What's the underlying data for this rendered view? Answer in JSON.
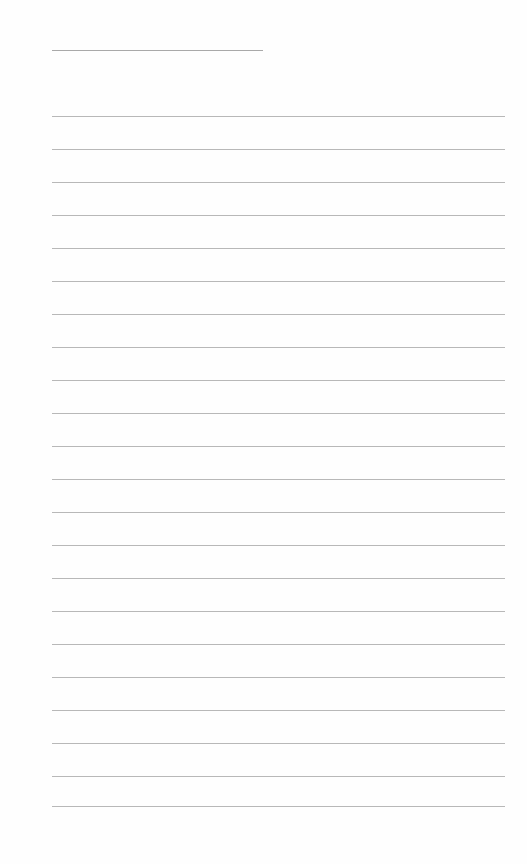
{
  "page": {
    "type": "blank lined notebook page",
    "header_line": {
      "x": 52,
      "y": 50,
      "width": 211
    },
    "rules": {
      "x": 52,
      "width": 453,
      "y_positions": [
        116,
        149,
        182,
        215,
        248,
        281,
        314,
        347,
        380,
        413,
        446,
        479,
        512,
        545,
        578,
        611,
        644,
        677,
        710,
        743,
        776,
        806
      ]
    },
    "colors": {
      "background": "#fefefe",
      "rule": "#a6a6a6"
    }
  }
}
